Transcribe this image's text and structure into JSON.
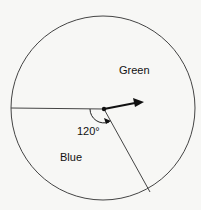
{
  "diagram": {
    "regions": [
      {
        "label": "Green"
      },
      {
        "label": "Blue"
      }
    ],
    "angle_label": "120°",
    "colors": {
      "stroke": "#333333",
      "background": "#f7f7f5"
    }
  }
}
